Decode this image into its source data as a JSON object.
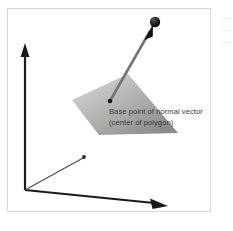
{
  "figure": {
    "kind": "3d-vector-diagram",
    "background_color": "#ffffff",
    "frame_color": "#d8d8d8",
    "annotation": {
      "line1": "Base point of normal vector",
      "line2": "(center of polygon)",
      "text_color": "#3a3a3a"
    },
    "axes": {
      "color": "#1a1a1a",
      "origin_label": "origin",
      "z_axis_label": "z-axis",
      "y_axis_label": "y-axis",
      "x_axis_label": "x-axis"
    },
    "polygon": {
      "name": "polygon-surface",
      "fill_light": "#c9c9c9",
      "fill_dark": "#8e8e8e"
    },
    "normal_vector": {
      "name": "normal-vector",
      "shaft_color": "#6e6e6e",
      "arrow_color": "#111111",
      "tip_marker": "sphere",
      "base_marker": "dot"
    }
  }
}
